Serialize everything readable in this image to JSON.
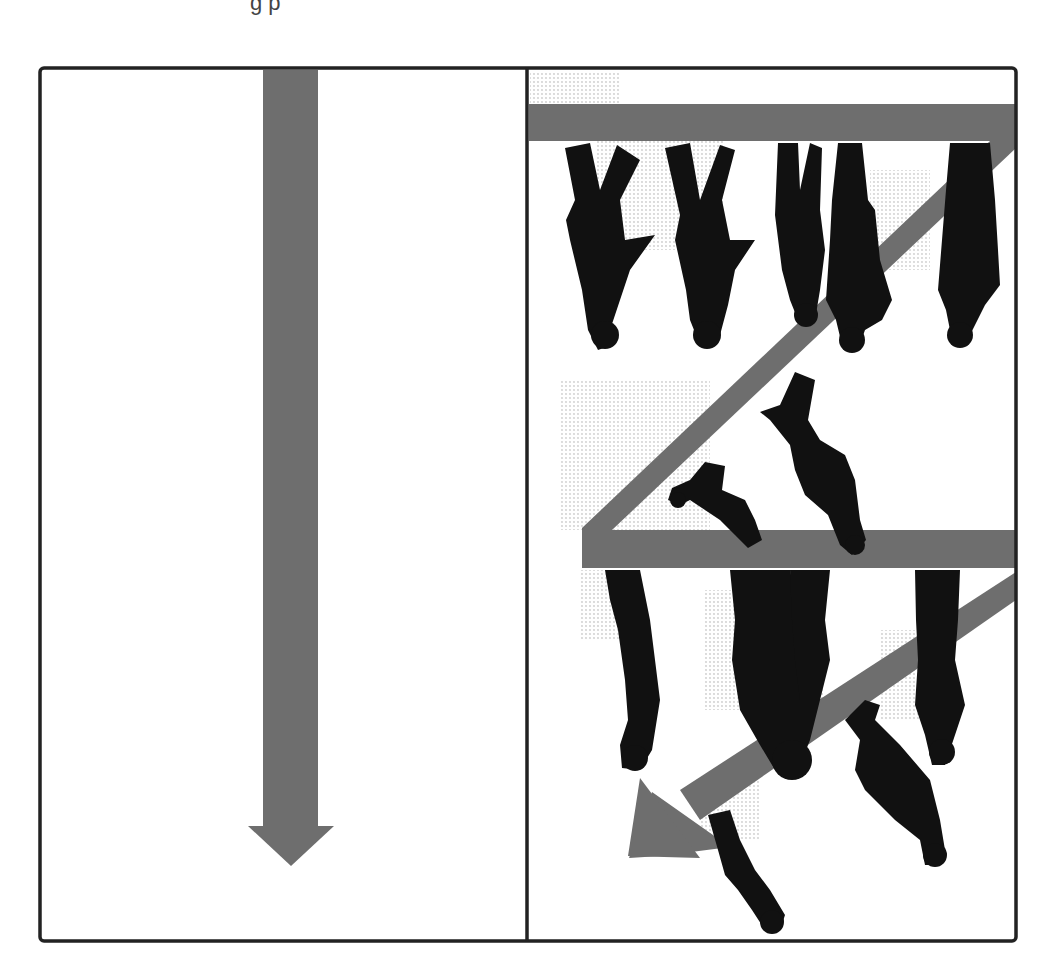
{
  "figure": {
    "caption_fragment": "g p",
    "panels": [
      {
        "id": "left",
        "description": "Single straight downward flow",
        "arrow": {
          "direction": "down"
        }
      },
      {
        "id": "right",
        "description": "Serpentine queue with upside-down walking silhouettes",
        "path": [
          "horizontal-top",
          "diagonal-down-left",
          "horizontal-middle",
          "diagonal-down-left-arrow"
        ],
        "figure_count": 12
      }
    ],
    "colors": {
      "border": "#222222",
      "arrow_fill": "#6e6e6e",
      "silhouette": "#111111",
      "halftone": "#d8d8d8",
      "background": "#ffffff"
    }
  }
}
